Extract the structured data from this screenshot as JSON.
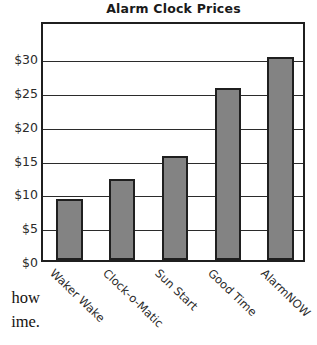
{
  "chart_data": {
    "type": "bar",
    "title": "Alarm Clock Prices",
    "xlabel": "",
    "ylabel": "",
    "categories": [
      "Waker Wake",
      "Clock-o-Matic",
      "Sun Start",
      "Good Time",
      "AlarmNOW"
    ],
    "values": [
      9,
      12,
      15.4,
      25.5,
      30
    ],
    "ytick_labels": [
      "$0",
      "$5",
      "$10",
      "$15",
      "$20",
      "$25",
      "$30"
    ],
    "ytick_values": [
      0,
      5,
      10,
      15,
      20,
      25,
      30
    ],
    "ylim": [
      0,
      35.5
    ],
    "grid": true,
    "legend": false,
    "bar_color": "#838383",
    "bar_edge_color": "#1f1f1f",
    "axis_color": "#1f1f1f",
    "grid_color": "#2b2b2b",
    "text_color": "#2b2b2b",
    "title_color": "#1a1a1a",
    "background": "#ffffff",
    "xtick_rotation": "-45"
  },
  "page_text": {
    "fragment_1": "how",
    "fragment_2": "ime."
  }
}
